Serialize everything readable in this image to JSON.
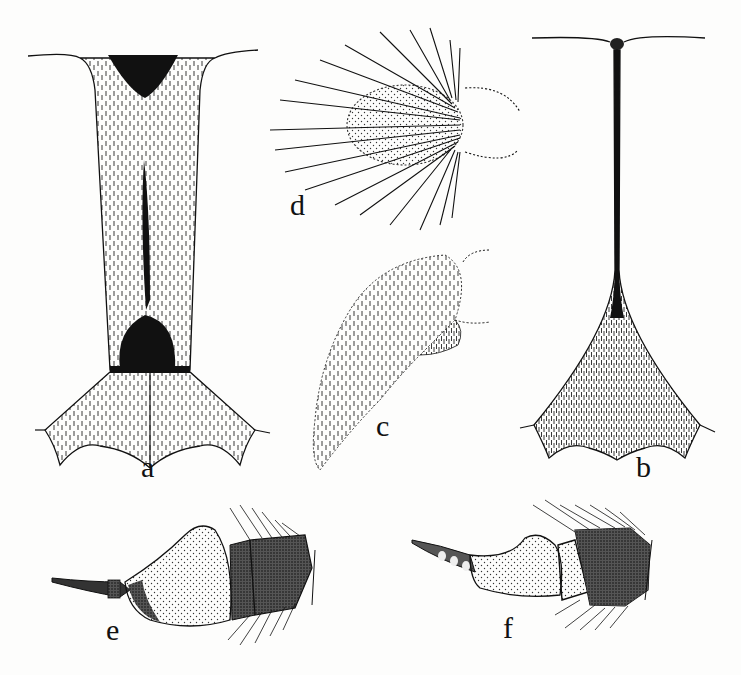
{
  "plate": {
    "background": "#fdfdfc",
    "ink": "#111111",
    "figures": [
      {
        "id": "a",
        "label": "a",
        "description": "elongate sclerite, ventral view, setose with dark basal and apical patches",
        "label_pos": [
          141,
          452
        ]
      },
      {
        "id": "b",
        "label": "b",
        "description": "narrow stalk-like sclerite widening into setose flared base",
        "label_pos": [
          636,
          452
        ]
      },
      {
        "id": "c",
        "label": "c",
        "description": "curved setose lobe with dotted outline",
        "label_pos": [
          376,
          411
        ]
      },
      {
        "id": "d",
        "label": "d",
        "description": "ovoid structure bearing long radiating setae",
        "label_pos": [
          290,
          190
        ]
      },
      {
        "id": "e",
        "label": "e",
        "description": "antenna-like segmented appendage, stippled, with setose apical segments",
        "label_pos": [
          106,
          615
        ]
      },
      {
        "id": "f",
        "label": "f",
        "description": "curved segmented appendage with dark setose terminal segment",
        "label_pos": [
          503,
          613
        ]
      }
    ]
  }
}
